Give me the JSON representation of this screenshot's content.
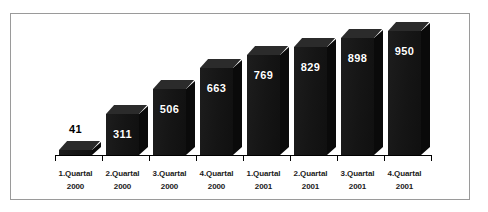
{
  "chart_data": {
    "type": "bar",
    "title": "",
    "subtitle": "",
    "xlabel": "",
    "ylabel": "",
    "grid": false,
    "legend": false,
    "three_d": true,
    "ylim": [
      0,
      1000
    ],
    "categories": [
      "1.Quartal 2000",
      "2.Quartal 2000",
      "3.Quartal 2000",
      "4.Quartal 2000",
      "1.Quartal 2001",
      "2.Quartal 2001",
      "3.Quartal 2001",
      "4.Quartal 2001"
    ],
    "category_lines": [
      {
        "quarter": "1.Quartal",
        "year": "2000"
      },
      {
        "quarter": "2.Quartal",
        "year": "2000"
      },
      {
        "quarter": "3.Quartal",
        "year": "2000"
      },
      {
        "quarter": "4.Quartal",
        "year": "2000"
      },
      {
        "quarter": "1.Quartal",
        "year": "2001"
      },
      {
        "quarter": "2.Quartal",
        "year": "2001"
      },
      {
        "quarter": "3.Quartal",
        "year": "2001"
      },
      {
        "quarter": "4.Quartal",
        "year": "2001"
      }
    ],
    "values": [
      41,
      311,
      506,
      663,
      769,
      829,
      898,
      950
    ],
    "value_labels": [
      "41",
      "311",
      "506",
      "663",
      "769",
      "829",
      "898",
      "950"
    ],
    "label_placement": [
      "outside-above",
      "inside",
      "inside",
      "inside",
      "inside",
      "inside",
      "inside",
      "inside"
    ],
    "colors": {
      "bar_front": "#181818",
      "bar_top": "#2b2b2b",
      "bar_side": "#0a0a0a",
      "label_inside": "#ffffff",
      "label_outside": "#000000",
      "axis": "#000000",
      "frame_border": "#9a9a9a",
      "background": "#ffffff"
    }
  }
}
